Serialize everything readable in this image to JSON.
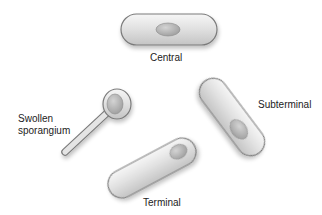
{
  "diagram": {
    "colors": {
      "background": "#ffffff",
      "cell_fill": "#d9d9d9",
      "cell_highlight": "#f4f4f4",
      "cell_outline": "#7a7a7a",
      "spore_fill": "#b5b5b5",
      "label_text": "#222222"
    },
    "cells": [
      {
        "id": "central",
        "label": "Central",
        "shape": "rod",
        "spore_position": "center"
      },
      {
        "id": "subterminal",
        "label": "Subterminal",
        "shape": "rod",
        "spore_position": "near end"
      },
      {
        "id": "terminal",
        "label": "Terminal",
        "shape": "rod",
        "spore_position": "end"
      },
      {
        "id": "swollen",
        "label_line1": "Swollen",
        "label_line2": "sporangium",
        "shape": "club",
        "spore_position": "swollen end"
      }
    ]
  }
}
